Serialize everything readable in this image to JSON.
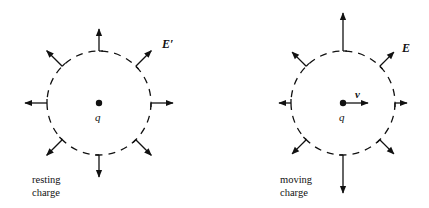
{
  "diagram": {
    "colors": {
      "ink": "#111111",
      "background": "#ffffff"
    },
    "left_panel": {
      "field_label": "E′",
      "charge_label": "q",
      "caption_line1": "resting",
      "caption_line2": "charge",
      "center": [
        99,
        103
      ],
      "radius": 52,
      "arrows": [
        {
          "angle_deg": 90,
          "length": 22
        },
        {
          "angle_deg": 45,
          "length": 22
        },
        {
          "angle_deg": 0,
          "length": 22
        },
        {
          "angle_deg": -45,
          "length": 22
        },
        {
          "angle_deg": -90,
          "length": 22
        },
        {
          "angle_deg": -135,
          "length": 22
        },
        {
          "angle_deg": 180,
          "length": 22
        },
        {
          "angle_deg": 135,
          "length": 22
        }
      ]
    },
    "right_panel": {
      "field_label": "E",
      "velocity_label": "v",
      "charge_label": "q",
      "caption_line1": "moving",
      "caption_line2": "charge",
      "center": [
        343,
        103
      ],
      "radius": 52,
      "arrows": [
        {
          "angle_deg": 90,
          "length": 38
        },
        {
          "angle_deg": 45,
          "length": 20
        },
        {
          "angle_deg": 0,
          "length": 12
        },
        {
          "angle_deg": -45,
          "length": 20
        },
        {
          "angle_deg": -90,
          "length": 38
        },
        {
          "angle_deg": -135,
          "length": 20
        },
        {
          "angle_deg": 180,
          "length": 12
        },
        {
          "angle_deg": 135,
          "length": 20
        }
      ]
    }
  }
}
